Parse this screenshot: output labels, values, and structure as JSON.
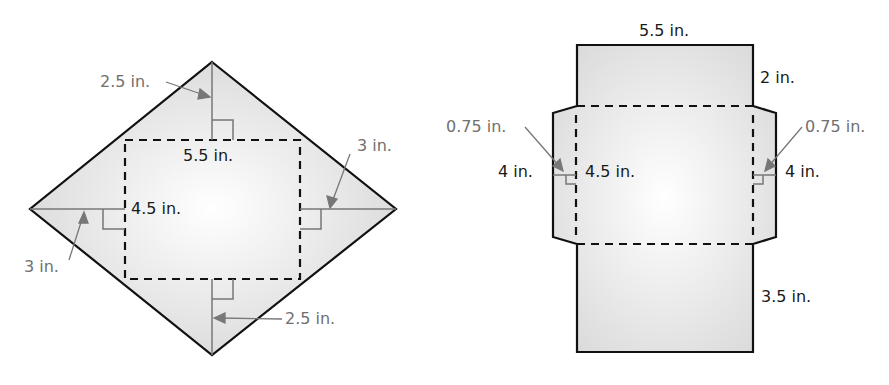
{
  "figures": [
    {
      "name": "rectangular-pyramid-net",
      "base": {
        "length_label": "5.5 in.",
        "width_label": "4.5 in."
      },
      "labels": {
        "top_height": "2.5 in.",
        "bottom_height": "2.5 in.",
        "left_height": "3 in.",
        "right_height": "3 in.",
        "base_length": "5.5 in.",
        "base_width": "4.5 in."
      }
    },
    {
      "name": "envelope-net",
      "labels": {
        "top_width": "5.5 in.",
        "top_flap_height": "2 in.",
        "middle_height": "4.5 in.",
        "left_tab_height": "0.75 in.",
        "right_tab_height": "0.75 in.",
        "left_tab_base": "4 in.",
        "right_tab_base": "4 in.",
        "bottom_flap_height": "3.5 in."
      }
    }
  ],
  "colors": {
    "outline": "#111111",
    "annotation": "#707070",
    "fill_light": "#f2f2f2",
    "fill_dark": "#d9d9d9"
  }
}
